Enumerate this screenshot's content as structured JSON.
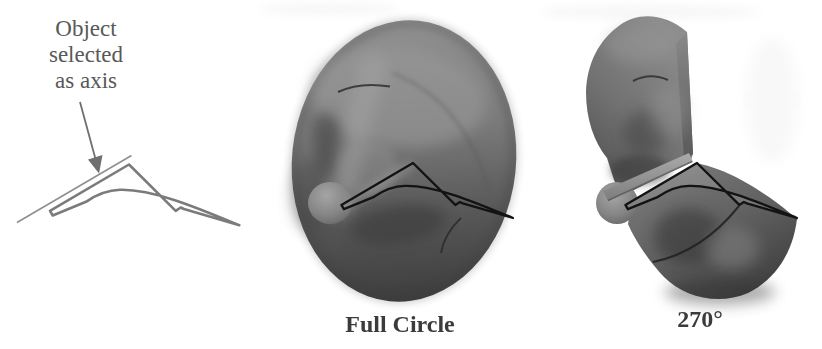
{
  "annotation": {
    "text": "Object\nselected\nas axis",
    "pointer_icon": "arrow-down-right"
  },
  "captions": {
    "full_circle": "Full Circle",
    "partial_revolve": "270°"
  },
  "colors": {
    "background": "#ffffff",
    "annotation_text": "#585858",
    "caption_text": "#3b3b3b",
    "axis_line": "#8f8f8f",
    "profile_outline": "#7b7b7b",
    "arrow": "#6f6f6f",
    "revolve_outline": "#131313",
    "surface_light": "#979797",
    "surface_mid": "#707070",
    "surface_dark": "#404040"
  }
}
